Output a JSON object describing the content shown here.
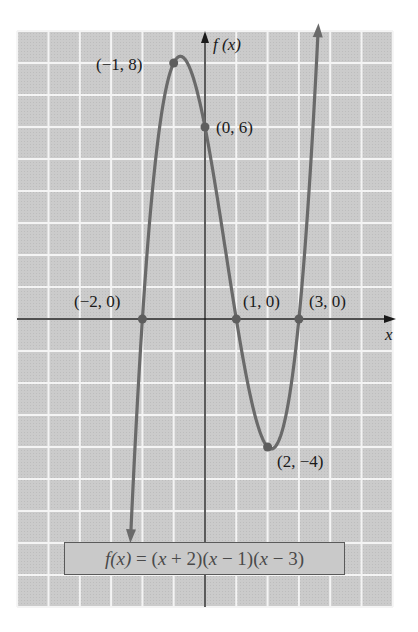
{
  "chart_data": {
    "type": "line",
    "title": "",
    "function": "f(x) = (x + 2)(x - 1)(x - 3)",
    "xlabel": "x",
    "ylabel": "f(x)",
    "xlim": [
      -6,
      6
    ],
    "ylim": [
      -9,
      9
    ],
    "grid": true,
    "series": [
      {
        "name": "f(x)",
        "x_range": [
          -2.37,
          3.61
        ],
        "color": "#6a6a6a"
      }
    ],
    "points": [
      {
        "x": -1,
        "y": 8,
        "label": "(−1, 8)"
      },
      {
        "x": 0,
        "y": 6,
        "label": "(0, 6)"
      },
      {
        "x": -2,
        "y": 0,
        "label": "(−2, 0)"
      },
      {
        "x": 1,
        "y": 0,
        "label": "(1, 0)"
      },
      {
        "x": 3,
        "y": 0,
        "label": "(3, 0)"
      },
      {
        "x": 2,
        "y": -4,
        "label": "(2, −4)"
      }
    ],
    "annotations": [
      "(−1, 8)",
      "(0, 6)",
      "(−2, 0)",
      "(1, 0)",
      "(3, 0)",
      "(2, −4)"
    ]
  },
  "axes": {
    "x_label": "x",
    "y_label_f": "f",
    "y_label_paren": "(x)"
  },
  "formula": {
    "f": "f",
    "x1": "(x)",
    "rest_a": " = (",
    "x2": "x",
    "rest_b": " + 2)(",
    "x3": "x",
    "rest_c": " − 1)(",
    "x4": "x",
    "rest_d": " − 3)"
  },
  "colors": {
    "grid_bg": "#c9c9c9",
    "grid_line": "#f4f4f4",
    "curve": "#6a6a6a",
    "axis": "#1a1a1a"
  }
}
